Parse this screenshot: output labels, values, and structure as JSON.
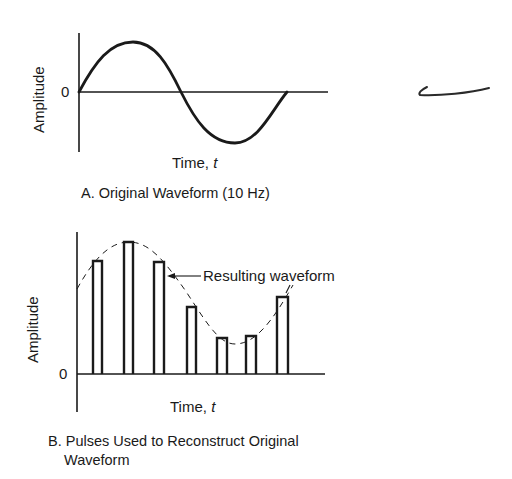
{
  "panel_a": {
    "y_label": "Amplitude",
    "zero_label": "0",
    "x_label": "Time, ",
    "x_label_var": "t",
    "caption": "A. Original Waveform (10 Hz)",
    "waveform": "sine, one full cycle"
  },
  "panel_b": {
    "y_label": "Amplitude",
    "zero_label": "0",
    "x_label": "Time, ",
    "x_label_var": "t",
    "annotation": "Resulting waveform",
    "caption_line1": "B. Pulses Used to Reconstruct Original",
    "caption_line2": "Waveform",
    "pulses": [
      {
        "index": 1,
        "relative_height": 0.86
      },
      {
        "index": 2,
        "relative_height": 1.0
      },
      {
        "index": 3,
        "relative_height": 0.85
      },
      {
        "index": 4,
        "relative_height": 0.51
      },
      {
        "index": 5,
        "relative_height": 0.27
      },
      {
        "index": 6,
        "relative_height": 0.29
      },
      {
        "index": 7,
        "relative_height": 0.58
      }
    ]
  },
  "margin_mark": "handwritten pen stroke",
  "colors": {
    "ink": "#1a1a1a",
    "background": "#ffffff"
  }
}
